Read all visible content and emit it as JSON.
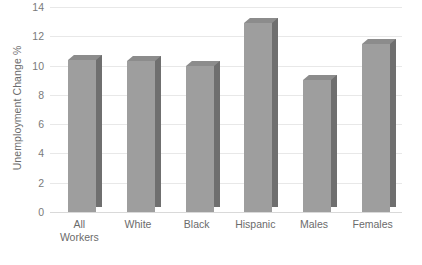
{
  "chart_data": {
    "type": "bar",
    "title": "",
    "subtitle": "",
    "xlabel": "",
    "ylabel": "Unemployment Change %",
    "categories": [
      "All Workers",
      "White",
      "Black",
      "Hispanic",
      "Males",
      "Females"
    ],
    "category_lines": [
      [
        "All",
        "Workers"
      ],
      [
        "White"
      ],
      [
        "Black"
      ],
      [
        "Hispanic"
      ],
      [
        "Males"
      ],
      [
        "Females"
      ]
    ],
    "values": [
      10.4,
      10.3,
      10.0,
      12.9,
      9.0,
      11.5
    ],
    "series": [
      {
        "name": "Unemployment Change %",
        "values": [
          10.4,
          10.3,
          10.0,
          12.9,
          9.0,
          11.5
        ]
      }
    ],
    "ylim": [
      0,
      14
    ],
    "ytick_step": 2,
    "ytick_labels": [
      "0",
      "2",
      "4",
      "6",
      "8",
      "10",
      "12",
      "14"
    ],
    "ytick_values": [
      0,
      2,
      4,
      6,
      8,
      10,
      12,
      14
    ],
    "grid": true,
    "grid_axis": "y",
    "legend": false,
    "legend_position": "none",
    "bar_style": "3d",
    "colors": {
      "bar_front": "#9e9e9e",
      "bar_side": "#6f6f6f",
      "bar_top": "#8c8c8c",
      "gridline": "#e8e8e8",
      "baseline": "#d9d9d9",
      "tick_text": "#7a7a7a",
      "axis_title": "#6b6b6b",
      "background": "#ffffff"
    }
  }
}
